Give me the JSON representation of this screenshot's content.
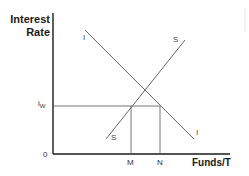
{
  "diagram": {
    "y_axis": {
      "label_line1": "Interest",
      "label_line2": "Rate"
    },
    "x_axis": {
      "label": "Funds/T"
    },
    "origin_label": "0",
    "curves": [
      {
        "name": "I",
        "label_top": "I",
        "label_bottom": "I",
        "description": "downward-sloping investment demand curve"
      },
      {
        "name": "S",
        "label_top": "S",
        "label_bottom": "S",
        "description": "upward-sloping saving supply curve"
      }
    ],
    "rate_level": {
      "symbol": "i",
      "subscript": "W"
    },
    "quantity_markers": [
      "M",
      "N"
    ]
  },
  "colors": {
    "axis": "#1a1a1a",
    "line": "#555555",
    "text": "#2a2a2a"
  }
}
